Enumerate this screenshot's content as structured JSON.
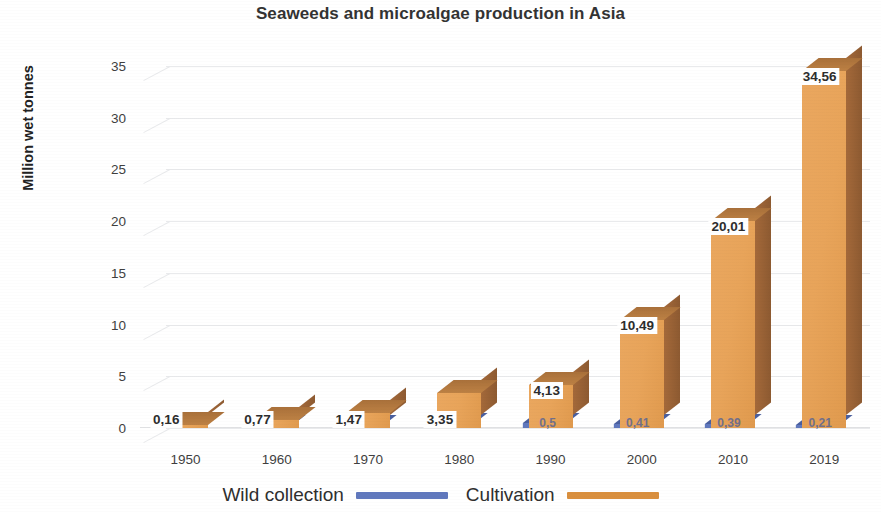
{
  "chart_data": {
    "type": "bar",
    "title": "Seaweeds and microalgae production in Asia",
    "xlabel": "",
    "ylabel": "Million wet tonnes",
    "categories": [
      "1950",
      "1960",
      "1970",
      "1980",
      "1990",
      "2000",
      "2010",
      "2019"
    ],
    "ylim": [
      0,
      35
    ],
    "yticks": [
      "0",
      "5",
      "10",
      "15",
      "20",
      "25",
      "30",
      "35"
    ],
    "grid": true,
    "legend_position": "bottom",
    "render_style": "3d-column",
    "series": [
      {
        "name": "Wild collection",
        "color": "#6078bd",
        "values": [
          0.16,
          0.2,
          0.3,
          0.45,
          0.5,
          0.41,
          0.39,
          0.21
        ],
        "labels": [
          "",
          "",
          "",
          "",
          "0,5",
          "0,41",
          "0,39",
          "0,21"
        ]
      },
      {
        "name": "Cultivation",
        "color": "#e8a45a",
        "values": [
          0.16,
          0.77,
          1.47,
          3.35,
          4.13,
          10.49,
          20.01,
          34.56
        ],
        "labels": [
          "0,16",
          "0,77",
          "1,47",
          "3,35",
          "4,13",
          "10,49",
          "20,01",
          "34,56"
        ]
      }
    ]
  },
  "legend": {
    "items": [
      {
        "label": "Wild collection",
        "color": "#6078bd"
      },
      {
        "label": "Cultivation",
        "color": "#d98f3e"
      }
    ]
  }
}
